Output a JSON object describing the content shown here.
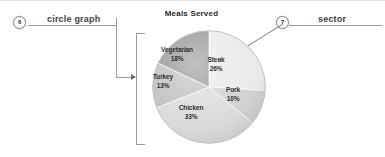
{
  "figure": {
    "callouts": [
      {
        "number": "6",
        "label": "circle graph",
        "icon": "number-badge-icon",
        "connector": "bracket-arrow"
      },
      {
        "number": "7",
        "label": "sector",
        "icon": "number-badge-icon",
        "connector": "diagonal-arrow"
      }
    ]
  },
  "chart_data": {
    "type": "pie",
    "title": "Meals Served",
    "xlabel": "",
    "ylabel": "",
    "legend": "none",
    "grid": false,
    "value_suffix": "%",
    "categories": [
      "Steak",
      "Pork",
      "Chicken",
      "Turkey",
      "Vegetarian"
    ],
    "values": [
      26,
      10,
      33,
      13,
      18
    ],
    "slices": [
      {
        "name": "Steak",
        "value": 26,
        "value_label": "26%",
        "color": "#e8e8e8"
      },
      {
        "name": "Pork",
        "value": 10,
        "value_label": "10%",
        "color": "#cfcfcf"
      },
      {
        "name": "Chicken",
        "value": 33,
        "value_label": "33%",
        "color": "#d9d9d9"
      },
      {
        "name": "Turkey",
        "value": 13,
        "value_label": "13%",
        "color": "#bdbdbd"
      },
      {
        "name": "Vegetarian",
        "value": 18,
        "value_label": "18%",
        "color": "#8f8f8f"
      }
    ],
    "total": 100
  }
}
